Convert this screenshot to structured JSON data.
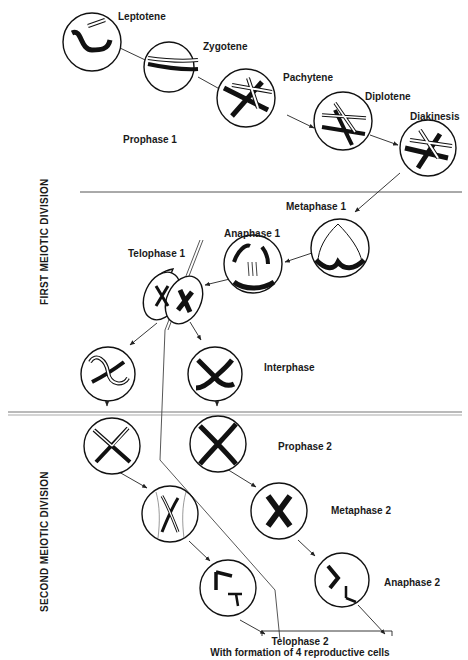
{
  "diagram": {
    "sections": {
      "first_division": "FIRST MEIOTIC DIVISION",
      "second_division": "SECOND MEIOTIC DIVISION"
    },
    "stages": {
      "leptotene": "Leptotene",
      "zygotene": "Zygotene",
      "pachytene": "Pachytene",
      "diplotene": "Diplotene",
      "diakinesis": "Diakinesis",
      "prophase1": "Prophase 1",
      "metaphase1": "Metaphase 1",
      "anaphase1": "Anaphase 1",
      "telophase1": "Telophase 1",
      "interphase": "Interphase",
      "prophase2": "Prophase 2",
      "metaphase2": "Metaphase 2",
      "anaphase2": "Anaphase 2",
      "telophase2": "Telophase 2",
      "telophase2_note": "With formation of 4 reproductive cells"
    }
  }
}
